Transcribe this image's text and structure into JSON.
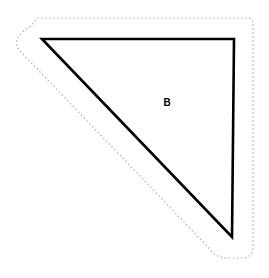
{
  "canvas": {
    "width": 269,
    "height": 278,
    "background_color": "#ffffff"
  },
  "figure": {
    "shapes": [
      {
        "name": "triangle-b",
        "kind": "polygon",
        "label": "B",
        "label_position": {
          "x": 167,
          "y": 103
        },
        "stroke_color": "#000000",
        "stroke_width": 2.6,
        "fill_color": "none",
        "line_style": "solid",
        "points": [
          {
            "x": 42,
            "y": 39
          },
          {
            "x": 234,
            "y": 39
          },
          {
            "x": 232,
            "y": 237
          }
        ]
      },
      {
        "name": "offset-outline",
        "kind": "path",
        "stroke_color": "#b4b4b4",
        "stroke_width": 1.2,
        "fill_color": "none",
        "line_style": "dotted",
        "dash_pattern": "1.6 2.4",
        "offset_distance": 22,
        "path": "M 37 18 L 248 18 Q 253 18 253 24 L 253 247 Q 253 258 241 258 L 228 258 Q 215 258 209 248 L 19 50 Q 14 43 19 36 Q 24 30 31 26 Q 34 22 37 18 Z"
      }
    ]
  },
  "chart_data": {
    "type": "diagram",
    "shapes": [
      {
        "id": "B",
        "type": "right-triangle",
        "vertices": [
          [
            42,
            39
          ],
          [
            234,
            39
          ],
          [
            232,
            237
          ]
        ],
        "right_angle_at": [
          234,
          39
        ],
        "leg_top_length_px": 192,
        "leg_right_length_px": 198,
        "hypotenuse_length_px": 274,
        "stroke": "#000000",
        "fill": "none"
      },
      {
        "id": "offset",
        "type": "dashed-offset-outline",
        "offset_px": 22,
        "stroke": "#b4b4b4",
        "fill": "none"
      }
    ],
    "labels": [
      {
        "text": "B",
        "x": 167,
        "y": 103,
        "bold": true
      }
    ],
    "xlim": [
      0,
      269
    ],
    "ylim": [
      0,
      278
    ],
    "grid": false,
    "legend": null
  }
}
